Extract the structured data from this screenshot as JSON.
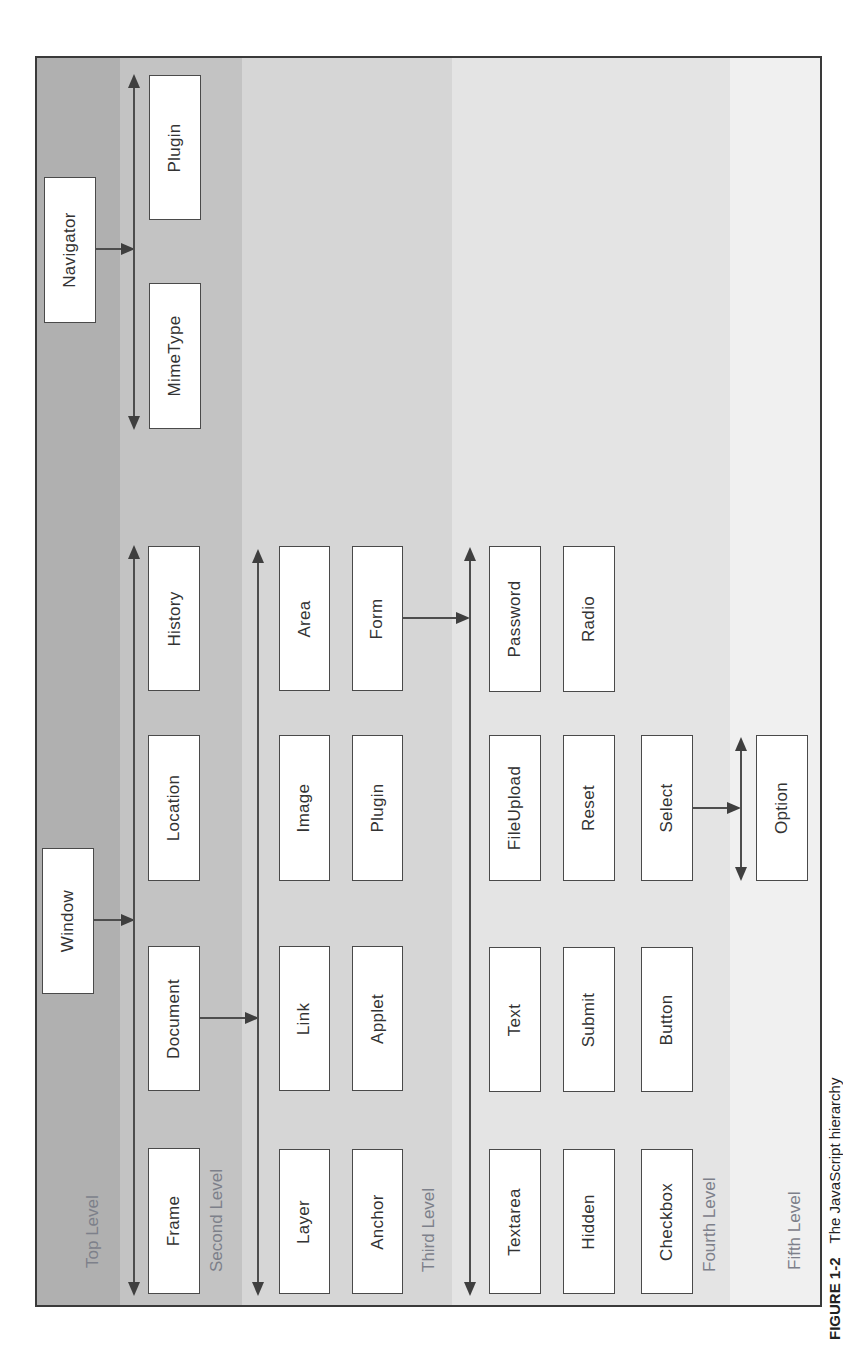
{
  "figure": {
    "caption_label": "FIGURE 1-2",
    "caption_text": "The JavaScript hierarchy",
    "orientation": "rotated 90° counter-clockwise"
  },
  "colors": {
    "level1_band": "#b0b0b0",
    "level2_band": "#c3c3c3",
    "level3_band": "#d6d6d6",
    "level4_band": "#e4e4e4",
    "level5_band": "#f0f0f0",
    "level_label": "#7d808a",
    "node_border": "#4a4a4a",
    "connector": "#4d4d4d"
  },
  "levels": [
    {
      "label": "Top Level"
    },
    {
      "label": "Second Level"
    },
    {
      "label": "Third Level"
    },
    {
      "label": "Fourth Level"
    },
    {
      "label": "Fifth Level"
    }
  ],
  "nodes": {
    "navigator": "Navigator",
    "window": "Window",
    "navigator_children": [
      "MimeType",
      "Plugin"
    ],
    "window_children": [
      "Frame",
      "Document",
      "Location",
      "History"
    ],
    "document_children": [
      "Layer",
      "Link",
      "Image",
      "Area",
      "Anchor",
      "Applet",
      "Plugin",
      "Form"
    ],
    "form_children": [
      "Textarea",
      "Text",
      "FileUpload",
      "Password",
      "Hidden",
      "Submit",
      "Reset",
      "Radio",
      "Checkbox",
      "Button",
      "Select"
    ],
    "select_children": [
      "Option"
    ]
  },
  "edges": [
    {
      "from": "Navigator",
      "to": [
        "MimeType",
        "Plugin"
      ]
    },
    {
      "from": "Window",
      "to": [
        "Frame",
        "Document",
        "Location",
        "History"
      ]
    },
    {
      "from": "Document",
      "to": [
        "Layer",
        "Link",
        "Image",
        "Area",
        "Anchor",
        "Applet",
        "Plugin",
        "Form"
      ]
    },
    {
      "from": "Form",
      "to": [
        "Textarea",
        "Text",
        "FileUpload",
        "Password",
        "Hidden",
        "Submit",
        "Reset",
        "Radio",
        "Checkbox",
        "Button",
        "Select"
      ]
    },
    {
      "from": "Select",
      "to": [
        "Option"
      ]
    }
  ]
}
